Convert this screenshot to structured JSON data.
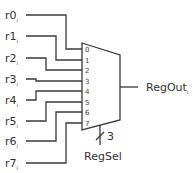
{
  "diagram": {
    "type": "multiplexer",
    "inputs": [
      {
        "name": "r0",
        "subscript": "i",
        "pin": "0"
      },
      {
        "name": "r1",
        "subscript": "i",
        "pin": "1"
      },
      {
        "name": "r2",
        "subscript": "i",
        "pin": "2"
      },
      {
        "name": "r3",
        "subscript": "i",
        "pin": "3"
      },
      {
        "name": "r4",
        "subscript": "i",
        "pin": "4"
      },
      {
        "name": "r5",
        "subscript": "i",
        "pin": "5"
      },
      {
        "name": "r6",
        "subscript": "i",
        "pin": "6"
      },
      {
        "name": "r7",
        "subscript": "i",
        "pin": "7"
      }
    ],
    "output": {
      "name": "RegOut",
      "subscript": "i"
    },
    "select": {
      "name": "RegSel",
      "width": "3"
    },
    "colors": {
      "stroke": "#3a3a3a",
      "text": "#333333"
    }
  }
}
